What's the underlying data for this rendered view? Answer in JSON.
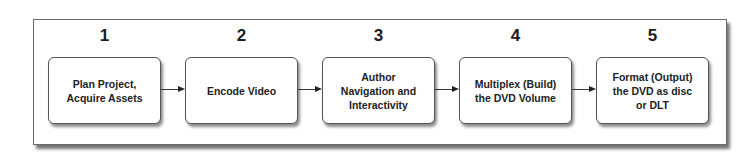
{
  "diagram": {
    "type": "process-flow",
    "steps": [
      {
        "number": "1",
        "label": "Plan Project,\nAcquire Assets"
      },
      {
        "number": "2",
        "label": "Encode Video"
      },
      {
        "number": "3",
        "label": "Author\nNavigation and\nInteractivity"
      },
      {
        "number": "4",
        "label": "Multiplex (Build)\nthe DVD Volume"
      },
      {
        "number": "5",
        "label": "Format (Output)\nthe DVD as disc\nor DLT"
      }
    ],
    "connections": [
      {
        "from": "1",
        "to": "2"
      },
      {
        "from": "2",
        "to": "3"
      },
      {
        "from": "3",
        "to": "4"
      },
      {
        "from": "4",
        "to": "5"
      }
    ]
  }
}
